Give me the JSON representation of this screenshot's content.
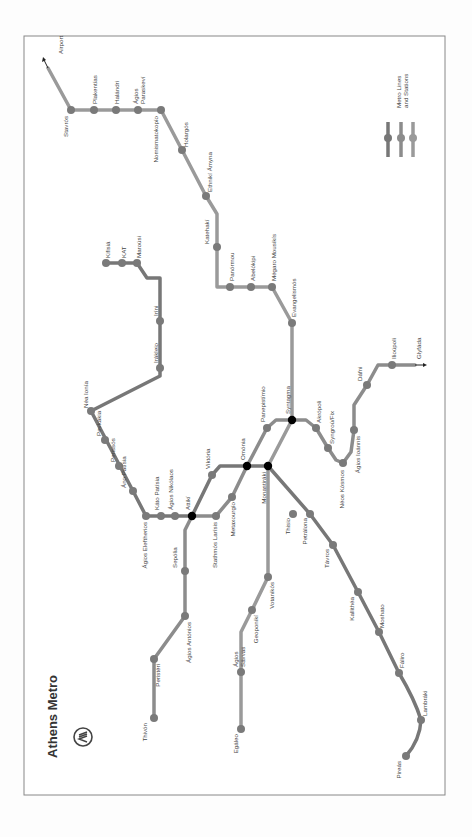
{
  "title": "Athens Metro",
  "legend": {
    "label_line1": "Metro Lines",
    "label_line2": "and Stations"
  },
  "colors": {
    "frame": "#888888",
    "line1": "#777777",
    "line2": "#8a8a8a",
    "line3": "#9a9a9a",
    "station": "#7a7a7a",
    "interchange": "#000000",
    "text": "#444444"
  },
  "lines": [
    {
      "name": "Line 1",
      "path": "M106,263 L152,263 L152,278 L158,278 L158,330 L159,367 L175,413 L210,489 L220,493 L255,493",
      "path2": "M255,493 L273,478 L278,467 L268,460 M278,467 L300,427 L318,427",
      "stations": [
        {
          "name": "Kifisiá",
          "x": 106,
          "y": 263,
          "lx": 110,
          "ly": 258,
          "rot": -90
        },
        {
          "name": "KAT",
          "x": 122,
          "y": 263,
          "lx": 126,
          "ly": 258,
          "rot": -90
        },
        {
          "name": "Maroúsi",
          "x": 137,
          "y": 263,
          "lx": 141,
          "ly": 258,
          "rot": -90
        },
        {
          "name": "Iríni",
          "x": 160,
          "y": 321,
          "lx": 158,
          "ly": 316,
          "rot": -90
        },
        {
          "name": "Irákleio",
          "x": 160,
          "y": 368,
          "lx": 158,
          "ly": 363,
          "rot": -90
        },
        {
          "name": "Néa Ionía",
          "x": 91,
          "y": 411,
          "lx": 88,
          "ly": 408,
          "rot": -90
        },
        {
          "name": "Pevkákia",
          "x": 105,
          "y": 440,
          "lx": 101,
          "ly": 436,
          "rot": -90
        },
        {
          "name": "Perissós",
          "x": 119,
          "y": 466,
          "lx": 115,
          "ly": 462,
          "rot": -90
        },
        {
          "name": "Áno Patísia",
          "x": 133,
          "y": 491,
          "lx": 126,
          "ly": 488,
          "rot": -90
        },
        {
          "name": "Thisio",
          "x": 293,
          "y": 514,
          "lx": 290,
          "ly": 518,
          "rot": -90
        },
        {
          "name": "Petrálona",
          "x": 310,
          "y": 514,
          "lx": 307,
          "ly": 518,
          "rot": -90
        }
      ]
    }
  ],
  "stations": [
    {
      "name": "Airport",
      "x": 63,
      "y": 60,
      "lx": 63,
      "ly": 54,
      "rot": -90,
      "terminal_arrow": true
    },
    {
      "name": "Stavrós",
      "x": 71,
      "y": 110,
      "lx": 68,
      "ly": 116,
      "rot": -90
    },
    {
      "name": "Plakentías",
      "x": 94,
      "y": 110,
      "lx": 97,
      "ly": 104,
      "rot": -90
    },
    {
      "name": "Halándri",
      "x": 116,
      "y": 110,
      "lx": 119,
      "ly": 104,
      "rot": -90
    },
    {
      "name": "Ágios Paraskeví",
      "x": 138,
      "y": 110,
      "lx": 138,
      "ly": 104,
      "rot": -90,
      "two_line": [
        "Ágios",
        "Paraskeví"
      ]
    },
    {
      "name": "Nomismatokopío",
      "x": 161,
      "y": 110,
      "lx": 158,
      "ly": 116,
      "rot": -90
    },
    {
      "name": "Holargós",
      "x": 182,
      "y": 150,
      "lx": 188,
      "ly": 147,
      "rot": -90
    },
    {
      "name": "Ethnikí Ámyna",
      "x": 206,
      "y": 196,
      "lx": 212,
      "ly": 192,
      "rot": -90
    },
    {
      "name": "Katehakí",
      "x": 217,
      "y": 247,
      "lx": 209,
      "ly": 244,
      "rot": -90
    },
    {
      "name": "Panórmou",
      "x": 230,
      "y": 287,
      "lx": 234,
      "ly": 281,
      "rot": -90
    },
    {
      "name": "Abelókipi",
      "x": 251,
      "y": 287,
      "lx": 255,
      "ly": 281,
      "rot": -90
    },
    {
      "name": "Mégaro Mousikís",
      "x": 272,
      "y": 287,
      "lx": 276,
      "ly": 281,
      "rot": -90
    },
    {
      "name": "Evangelismós",
      "x": 292,
      "y": 323,
      "lx": 296,
      "ly": 317,
      "rot": -90
    },
    {
      "name": "Syntagma",
      "x": 292,
      "y": 420,
      "lx": 290,
      "ly": 414,
      "rot": -90,
      "interchange": true
    },
    {
      "name": "Panepistímio",
      "x": 267,
      "y": 428,
      "lx": 265,
      "ly": 422,
      "rot": -90
    },
    {
      "name": "Omónia",
      "x": 247,
      "y": 466,
      "lx": 245,
      "ly": 460,
      "rot": -90,
      "interchange": true
    },
    {
      "name": "Monastiráki",
      "x": 268,
      "y": 466,
      "lx": 266,
      "ly": 472,
      "rot": -90,
      "interchange": true
    },
    {
      "name": "Viktória",
      "x": 212,
      "y": 475,
      "lx": 210,
      "ly": 469,
      "rot": -90
    },
    {
      "name": "Metaxourgío",
      "x": 232,
      "y": 497,
      "lx": 235,
      "ly": 502,
      "rot": -90
    },
    {
      "name": "Attikí",
      "x": 192,
      "y": 516,
      "lx": 190,
      "ly": 510,
      "rot": -90,
      "interchange": true
    },
    {
      "name": "Ágios Nikólaos",
      "x": 175,
      "y": 516,
      "lx": 173,
      "ly": 510,
      "rot": -90
    },
    {
      "name": "Káto Patísia",
      "x": 161,
      "y": 516,
      "lx": 159,
      "ly": 510,
      "rot": -90
    },
    {
      "name": "Ágios Eleftherios",
      "x": 146,
      "y": 516,
      "lx": 147,
      "ly": 522,
      "rot": -90
    },
    {
      "name": "Stathmós Larísis",
      "x": 216,
      "y": 516,
      "lx": 217,
      "ly": 522,
      "rot": -90
    },
    {
      "name": "Sepólia",
      "x": 185,
      "y": 571,
      "lx": 177,
      "ly": 568,
      "rot": -90
    },
    {
      "name": "Ágios Antónios",
      "x": 185,
      "y": 616,
      "lx": 191,
      "ly": 622,
      "rot": -90
    },
    {
      "name": "Peristéri",
      "x": 154,
      "y": 659,
      "lx": 160,
      "ly": 664,
      "rot": -90
    },
    {
      "name": "Thivón",
      "x": 154,
      "y": 718,
      "lx": 147,
      "ly": 723,
      "rot": -90
    },
    {
      "name": "Akrópoli",
      "x": 316,
      "y": 428,
      "lx": 321,
      "ly": 423,
      "rot": -90
    },
    {
      "name": "Syngroú/Fix",
      "x": 328,
      "y": 448,
      "lx": 334,
      "ly": 444,
      "rot": -90
    },
    {
      "name": "Néos Kósmos",
      "x": 343,
      "y": 463,
      "lx": 344,
      "ly": 470,
      "rot": -90
    },
    {
      "name": "Ágios Ioánnis",
      "x": 354,
      "y": 430,
      "lx": 360,
      "ly": 436,
      "rot": -90
    },
    {
      "name": "Dáfni",
      "x": 367,
      "y": 385,
      "lx": 362,
      "ly": 381,
      "rot": -90
    },
    {
      "name": "Ilioúpoli",
      "x": 392,
      "y": 365,
      "lx": 396,
      "ly": 359,
      "rot": -90
    },
    {
      "name": "Glyfáda",
      "x": 421,
      "y": 365,
      "lx": 421,
      "ly": 359,
      "rot": -90,
      "terminal_arrow": true
    },
    {
      "name": "Votanikós",
      "x": 268,
      "y": 577,
      "lx": 274,
      "ly": 582,
      "rot": -90
    },
    {
      "name": "Geoponikí",
      "x": 252,
      "y": 610,
      "lx": 258,
      "ly": 615,
      "rot": -90
    },
    {
      "name": "Ágios Sávvas",
      "x": 241,
      "y": 672,
      "lx": 238,
      "ly": 667,
      "rot": -90,
      "two_line": [
        "Ágios",
        "Sávvas"
      ]
    },
    {
      "name": "Egáleo",
      "x": 241,
      "y": 729,
      "lx": 238,
      "ly": 734,
      "rot": -90
    },
    {
      "name": "Távros",
      "x": 333,
      "y": 545,
      "lx": 329,
      "ly": 549,
      "rot": -90
    },
    {
      "name": "Kallithéa",
      "x": 358,
      "y": 592,
      "lx": 354,
      "ly": 597,
      "rot": -90
    },
    {
      "name": "Moshato",
      "x": 379,
      "y": 632,
      "lx": 384,
      "ly": 628,
      "rot": -90
    },
    {
      "name": "Fáliro",
      "x": 399,
      "y": 673,
      "lx": 404,
      "ly": 668,
      "rot": -90
    },
    {
      "name": "Lambráki",
      "x": 421,
      "y": 720,
      "lx": 427,
      "ly": 716,
      "rot": -90
    },
    {
      "name": "Pireás",
      "x": 406,
      "y": 756,
      "lx": 401,
      "ly": 761,
      "rot": -90
    }
  ]
}
